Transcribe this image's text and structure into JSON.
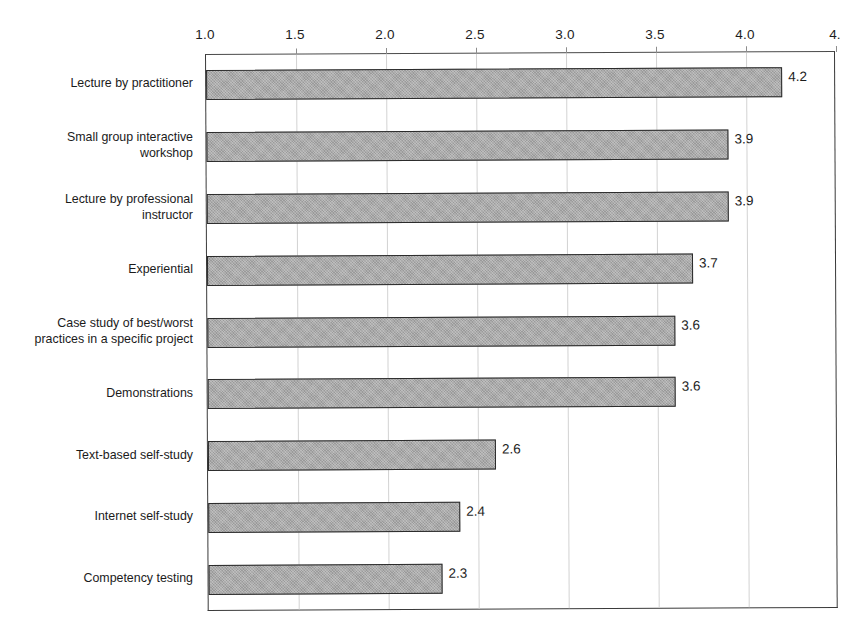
{
  "chart_data": {
    "type": "bar",
    "orientation": "horizontal",
    "title": "",
    "subtitle": "",
    "xlabel": "",
    "ylabel": "",
    "xlim": [
      1.0,
      4.5
    ],
    "ylim": null,
    "grid": true,
    "legend": null,
    "axis_position": "top",
    "categories": [
      "Lecture by practitioner",
      "Small group interactive\nworkshop",
      "Lecture by professional\ninstructor",
      "Experiential",
      "Case study of best/worst\npractices in a specific project",
      "Demonstrations",
      "Text-based self-study",
      "Internet self-study",
      "Competency testing"
    ],
    "values": [
      4.2,
      3.9,
      3.9,
      3.7,
      3.6,
      3.6,
      2.6,
      2.4,
      2.3
    ],
    "value_labels": [
      "4.2",
      "3.9",
      "3.9",
      "3.7",
      "3.6",
      "3.6",
      "2.6",
      "2.4",
      "2.3"
    ],
    "xticks": [
      1.0,
      1.5,
      2.0,
      2.5,
      3.0,
      3.5,
      4.0,
      4.5
    ],
    "xtick_labels": [
      "1.0",
      "1.5",
      "2.0",
      "2.5",
      "3.0",
      "3.5",
      "4.0",
      "4."
    ],
    "bar_fill_color": "#9a9a9a",
    "bar_edge_color": "#2b2b2b",
    "gridline_color": "#d2d2d2",
    "axis_color": "#3a3a3a",
    "text_color": "#1b1b1b"
  }
}
